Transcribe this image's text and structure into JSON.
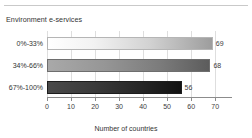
{
  "chart_data": {
    "type": "bar",
    "orientation": "horizontal",
    "title": "Environment e-services",
    "categories": [
      "0%-33%",
      "34%-66%",
      "67%-100%"
    ],
    "values": [
      69,
      68,
      56
    ],
    "value_labels": [
      "69",
      "68",
      "56"
    ],
    "xlabel": "Number of countries",
    "ylabel": "",
    "xlim": [
      0,
      77
    ],
    "xticks": [
      0,
      10,
      20,
      30,
      40,
      50,
      60,
      70
    ],
    "xticklabels": [
      "0",
      "10",
      "20",
      "30",
      "40",
      "50",
      "60",
      "70"
    ],
    "grid": "vertical",
    "legend": "none",
    "bar_colors": [
      "#e8e8e8",
      "#8a8a8a",
      "#2b2b2b"
    ],
    "axis_color": "#8c8c8c",
    "gridline_color": "#dedede",
    "rule_color": "#c9c9c9",
    "background": "#ffffff"
  }
}
